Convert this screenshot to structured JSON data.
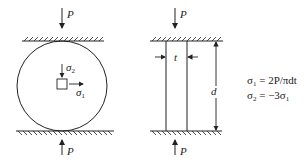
{
  "diagram": {
    "left_figure": {
      "top_load": "P",
      "bottom_load": "P",
      "stress_vertical": {
        "symbol": "σ",
        "sub": "2"
      },
      "stress_horizontal": {
        "symbol": "σ",
        "sub": "1"
      }
    },
    "right_figure": {
      "top_load": "P",
      "bottom_load": "P",
      "thickness_label": "t",
      "diameter_label": "d"
    },
    "equations": [
      {
        "lhs": "σ",
        "lhs_sub": "1",
        "rhs": " = 2P/πdt"
      },
      {
        "lhs": "σ",
        "lhs_sub": "2",
        "rhs": " = −3σ",
        "rhs_sub": "1"
      }
    ],
    "colors": {
      "line": "#222222",
      "background": "#ffffff"
    }
  }
}
